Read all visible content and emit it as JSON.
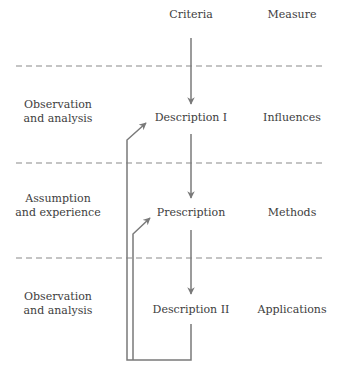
{
  "diagram": {
    "colors": {
      "line": "#7a7a7a",
      "dash": "#8a8a8a",
      "text": "#3d3d3d"
    },
    "center_column": {
      "header": "Criteria",
      "nodes": [
        "Description I",
        "Prescription",
        "Description II"
      ]
    },
    "right_column": {
      "header": "Measure",
      "items": [
        "Influences",
        "Methods",
        "Applications"
      ]
    },
    "left_column": {
      "items": [
        {
          "line1": "Observation",
          "line2": "and analysis"
        },
        {
          "line1": "Assumption",
          "line2": "and experience"
        },
        {
          "line1": "Observation",
          "line2": "and analysis"
        }
      ]
    }
  }
}
